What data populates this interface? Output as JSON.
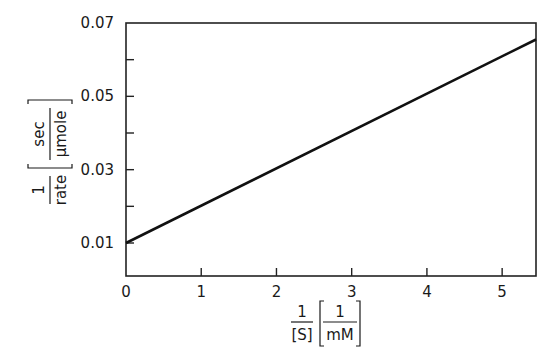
{
  "chart_data": {
    "type": "line",
    "title": "",
    "xlabel": {
      "fraction_numerator": "1",
      "fraction_denominator": "[S]",
      "unit_numerator": "1",
      "unit_denominator": "mM"
    },
    "ylabel": {
      "fraction_numerator": "1",
      "fraction_denominator": "rate",
      "unit_numerator": "sec",
      "unit_denominator": "µmole"
    },
    "xlim": [
      0,
      5.45
    ],
    "ylim": [
      0.001,
      0.07
    ],
    "x_ticks": [
      0,
      1,
      2,
      3,
      4,
      5
    ],
    "x_tick_labels": [
      "0",
      "1",
      "2",
      "3",
      "4",
      "5"
    ],
    "y_ticks": [
      0.01,
      0.02,
      0.03,
      0.04,
      0.05,
      0.06,
      0.07
    ],
    "y_tick_labels": [
      "0.01",
      "",
      "0.03",
      "",
      "0.05",
      "",
      "0.07"
    ],
    "grid": false,
    "legend": null,
    "series": [
      {
        "name": "1/rate vs 1/[S]",
        "x": [
          0,
          5.45
        ],
        "y": [
          0.01,
          0.0655
        ],
        "color": "#111111"
      }
    ]
  }
}
